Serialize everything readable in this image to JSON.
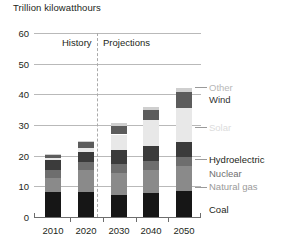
{
  "chart_data": {
    "type": "bar",
    "title": "Trillion kilowatthours",
    "subtitle": "",
    "xlabel": "",
    "ylabel": "Trillion kilowatthours",
    "ylim": [
      0,
      60
    ],
    "yticks": [
      0,
      10,
      20,
      30,
      40,
      50,
      60
    ],
    "grid": true,
    "stacked": true,
    "legend_position": "right",
    "categories": [
      "2010",
      "2020",
      "2030",
      "2040",
      "2050"
    ],
    "series": [
      {
        "name": "Coal",
        "color": "#161616",
        "values": [
          8.2,
          8.3,
          7.3,
          7.7,
          8.4
        ]
      },
      {
        "name": "Natural gas",
        "color": "#8a8a8a",
        "values": [
          4.5,
          7.1,
          7.1,
          7.6,
          8.1
        ]
      },
      {
        "name": "Nuclear",
        "color": "#6e6e6e",
        "values": [
          2.6,
          2.6,
          3.0,
          3.1,
          3.2
        ]
      },
      {
        "name": "Hydroelectric",
        "color": "#3b3b3b",
        "values": [
          3.4,
          3.3,
          4.5,
          4.8,
          4.6
        ]
      },
      {
        "name": "Solar",
        "color": "#e8e8e8",
        "values": [
          0.6,
          1.3,
          5.0,
          8.5,
          11.4
        ]
      },
      {
        "name": "Wind",
        "color": "#5c5c5c",
        "values": [
          1.0,
          1.7,
          2.8,
          3.3,
          5.0
        ]
      },
      {
        "name": "Other",
        "color": "#cfcfcf",
        "values": [
          0.2,
          0.6,
          0.8,
          0.9,
          1.3
        ]
      }
    ],
    "totals": [
      20.5,
      24.9,
      30.5,
      35.9,
      42.0
    ],
    "annotations": [
      {
        "text": "History",
        "x": "left-of-divider"
      },
      {
        "text": "Projections",
        "x": "right-of-divider"
      }
    ],
    "divider_between": [
      "2020",
      "2030"
    ]
  },
  "axis_title": "Trillion kilowatthours",
  "period": {
    "history": "History",
    "projections": "Projections"
  },
  "yticks": [
    "60",
    "50",
    "40",
    "30",
    "20",
    "10",
    "0"
  ],
  "xticks": [
    "2010",
    "2020",
    "2030",
    "2040",
    "2050"
  ],
  "legend": [
    {
      "label": "Other",
      "color": "#b8b8b8"
    },
    {
      "label": "Wind",
      "color": "#333333"
    },
    {
      "label": "Solar",
      "color": "#d8d8d8"
    },
    {
      "label": "Hydroelectric",
      "color": "#231f20"
    },
    {
      "label": "Nuclear",
      "color": "#7a7a7a"
    },
    {
      "label": "Natural gas",
      "color": "#a0a0a0"
    },
    {
      "label": "Coal",
      "color": "#231f20"
    }
  ]
}
